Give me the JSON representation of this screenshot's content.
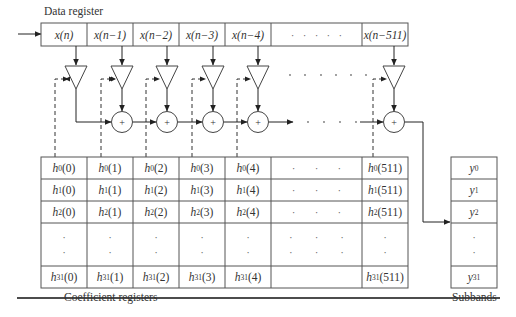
{
  "diagram": {
    "data_register": {
      "title": "Data register",
      "cells": [
        "x(n)",
        "x(n−1)",
        "x(n−2)",
        "x(n−3)",
        "x(n−4)",
        "·   ·   ·   ·   ·",
        "x(n−511)"
      ]
    },
    "coefficient_registers": {
      "caption": "Coefficient registers",
      "rows": [
        {
          "h": "h",
          "sub": "0",
          "cells": [
            "(0)",
            "(1)",
            "(2)",
            "(3)",
            "(4)"
          ],
          "last": "(511)"
        },
        {
          "h": "h",
          "sub": "1",
          "cells": [
            "(0)",
            "(1)",
            "(2)",
            "(3)",
            "(4)"
          ],
          "last": "(511)"
        },
        {
          "h": "h",
          "sub": "2",
          "cells": [
            "(0)",
            "(1)",
            "(2)",
            "(3)",
            "(4)"
          ],
          "last": "(511)"
        },
        {
          "h": "h",
          "sub": "31",
          "cells": [
            "(0)",
            "(1)",
            "(2)",
            "(3)",
            "(4)"
          ],
          "last": "(511)"
        }
      ],
      "ellipsis_h": "·       ·       ·",
      "ellipsis_v": "·"
    },
    "subbands": {
      "caption": "Subbands",
      "cells": [
        {
          "y": "y",
          "sub": "0"
        },
        {
          "y": "y",
          "sub": "1"
        },
        {
          "y": "y",
          "sub": "2"
        },
        {
          "y": "y",
          "sub": "31"
        }
      ]
    },
    "adder_symbol": "+",
    "ellipsis_dots": "·"
  }
}
